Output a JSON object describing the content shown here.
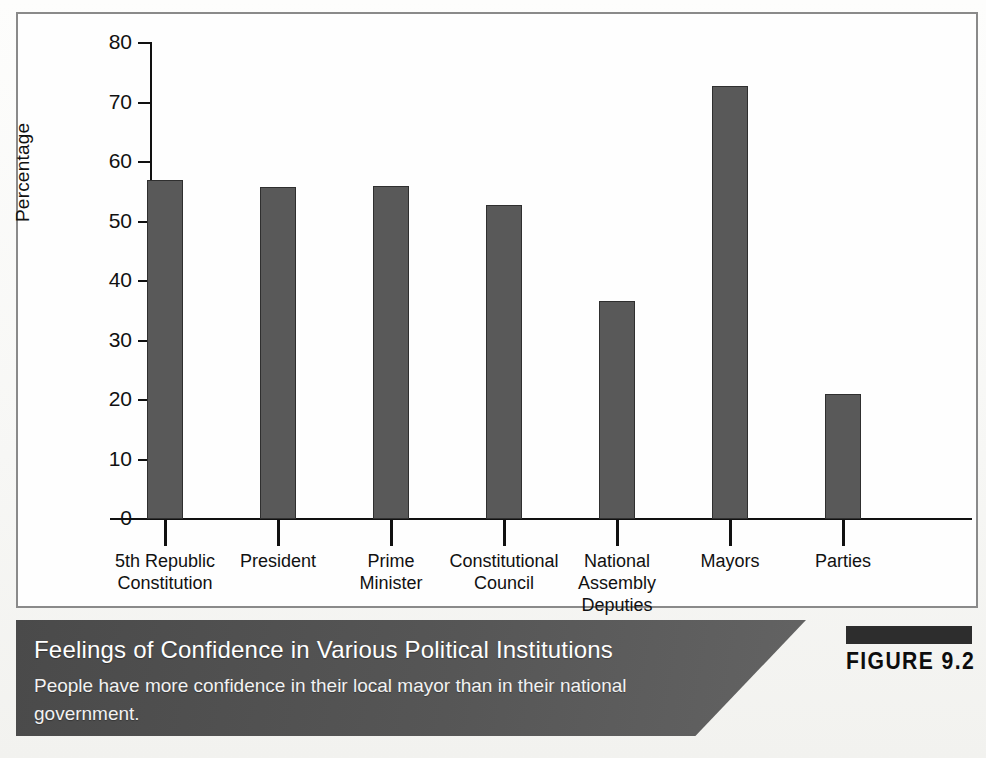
{
  "figure": {
    "tag_label": "FIGURE 9.2",
    "caption_title": "Feelings of Confidence in Various Political Institutions",
    "caption_subtitle": "People have more confidence in their local mayor than in their national government."
  },
  "colors": {
    "bar_fill": "#595959",
    "bar_stroke": "#2f2f2f",
    "axis": "#111111",
    "frame": "#8a8a8a",
    "caption_band": "#565656",
    "caption_text": "#ffffff",
    "figure_tag": "#0d0d0d"
  },
  "chart_data": {
    "type": "bar",
    "title": "Feelings of Confidence in Various Political Institutions",
    "subtitle": "People have more confidence in their local mayor than in their national government.",
    "xlabel": "",
    "ylabel": "Percentage",
    "ylim": [
      0,
      80
    ],
    "yticks": [
      0,
      10,
      20,
      30,
      40,
      50,
      60,
      70,
      80
    ],
    "ytick_labels": [
      "0",
      "10",
      "20",
      "30",
      "40",
      "50",
      "60",
      "70",
      "80"
    ],
    "grid": false,
    "legend": false,
    "categories": [
      "5th Republic\nConstitution",
      "President",
      "Prime\nMinister",
      "Constitutional\nCouncil",
      "National\nAssembly\nDeputies",
      "Mayors",
      "Parties"
    ],
    "category_lines": [
      [
        "5th Republic",
        "Constitution"
      ],
      [
        "President"
      ],
      [
        "Prime",
        "Minister"
      ],
      [
        "Constitutional",
        "Council"
      ],
      [
        "National",
        "Assembly",
        "Deputies"
      ],
      [
        "Mayors"
      ],
      [
        "Parties"
      ]
    ],
    "values": [
      57.0,
      55.8,
      55.9,
      52.7,
      36.6,
      72.7,
      21.0
    ],
    "units": "percent"
  }
}
